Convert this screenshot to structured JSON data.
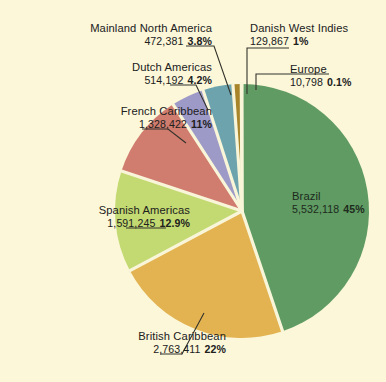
{
  "figure": {
    "background_color": "#fbf7d8",
    "text_color": "#20201c",
    "slice_divider_color": "#f7f3d5"
  },
  "chart_data": {
    "type": "pie",
    "title": "",
    "subtitle": "",
    "xlabel": "",
    "ylabel": "",
    "legend_position": "callout-labels",
    "grid": false,
    "start_angle_deg": -90,
    "direction": "clockwise",
    "categories": [
      "Brazil",
      "British Caribbean",
      "Spanish Americas",
      "French Caribbean",
      "Dutch Americas",
      "Mainland North America",
      "Danish West Indies",
      "Europe"
    ],
    "values": [
      5532118,
      2763411,
      1591245,
      1328422,
      514192,
      472381,
      129867,
      10798
    ],
    "value_labels": [
      "5,532,118",
      "2,763,411",
      "1,591,245",
      "1,328,422",
      "514,192",
      "472,381",
      "129,867",
      "10,798"
    ],
    "percents": [
      45,
      22,
      12.9,
      11,
      4.2,
      3.8,
      1,
      0.1
    ],
    "percent_labels": [
      "45%",
      "22%",
      "12.9%",
      "11%",
      "4.2%",
      "3.8%",
      "1%",
      "0.1%"
    ],
    "colors": [
      "#5f9b63",
      "#e3b351",
      "#c3d munged",
      "#d07c6e",
      "#9e9ac8",
      "#6ca3ad",
      "#a8852a",
      "#f4efc9"
    ],
    "slices": [
      {
        "label": "Brazil",
        "value": 5532118,
        "value_label": "5,532,118",
        "percent": 45,
        "percent_label": "45%",
        "color": "#5f9b63"
      },
      {
        "label": "British Caribbean",
        "value": 2763411,
        "value_label": "2,763,411",
        "percent": 22,
        "percent_label": "22%",
        "color": "#e3b351"
      },
      {
        "label": "Spanish Americas",
        "value": 1591245,
        "value_label": "1,591,245",
        "percent": 12.9,
        "percent_label": "12.9%",
        "color": "#c3d972"
      },
      {
        "label": "French Caribbean",
        "value": 1328422,
        "value_label": "1,328,422",
        "percent": 11,
        "percent_label": "11%",
        "color": "#d07c6e"
      },
      {
        "label": "Dutch Americas",
        "value": 514192,
        "value_label": "514,192",
        "percent": 4.2,
        "percent_label": "4.2%",
        "color": "#9e9ac8"
      },
      {
        "label": "Mainland North America",
        "value": 472381,
        "value_label": "472,381",
        "percent": 3.8,
        "percent_label": "3.8%",
        "color": "#6ca3ad"
      },
      {
        "label": "Danish West Indies",
        "value": 129867,
        "value_label": "129,867",
        "percent": 1,
        "percent_label": "1%",
        "color": "#a8852a"
      },
      {
        "label": "Europe",
        "value": 10798,
        "value_label": "10,798",
        "percent": 0.1,
        "percent_label": "0.1%",
        "color": "#efe9bf"
      }
    ],
    "total": 12342434
  }
}
